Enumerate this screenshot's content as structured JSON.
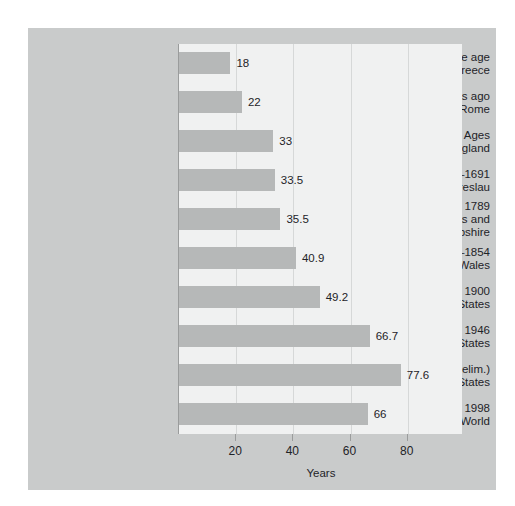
{
  "chart_data": {
    "type": "bar",
    "orientation": "horizontal",
    "title": "",
    "xlabel": "Years",
    "ylabel": "",
    "xlim": [
      0,
      99
    ],
    "xticks": [
      20,
      40,
      60,
      80
    ],
    "grid": "vertical",
    "legend": "none",
    "categories": [
      "Early iron and bronze age Greece",
      "About 2,000 years ago Rome",
      "Middle Ages England",
      "1687–1691 Breslau",
      "Before 1789 Massachusetts and New Hampshire",
      "1838–1854 England and Wales",
      "1900 United States",
      "1946 United States",
      "2003 (prelim.) United States",
      "1998 World"
    ],
    "category_lines": [
      [
        "Early iron and bronze age",
        "Greece"
      ],
      [
        "About 2,000 years ago",
        "Rome"
      ],
      [
        "Middle Ages",
        "England"
      ],
      [
        "1687–1691",
        "Breslau"
      ],
      [
        "Before 1789",
        "Massachusetts and",
        "New Hampshire"
      ],
      [
        "1838–1854",
        "England and Wales"
      ],
      [
        "1900",
        "United States"
      ],
      [
        "1946",
        "United States"
      ],
      [
        "2003 (prelim.)",
        "United States"
      ],
      [
        "1998",
        "World"
      ]
    ],
    "values": [
      18,
      22,
      33,
      33.5,
      35.5,
      40.9,
      49.2,
      66.7,
      77.6,
      66
    ],
    "value_labels": [
      "18",
      "22",
      "33",
      "33.5",
      "35.5",
      "40.9",
      "49.2",
      "66.7",
      "77.6",
      "66"
    ]
  },
  "colors": {
    "page_background": "#ffffff",
    "panel_background": "#c9cbcb",
    "plot_background": "#f0f1f1",
    "bar_fill": "#b6b8b8",
    "gridline": "#d6d8d8",
    "axis_line": "#9a9c9c",
    "text": "#1e2328"
  }
}
